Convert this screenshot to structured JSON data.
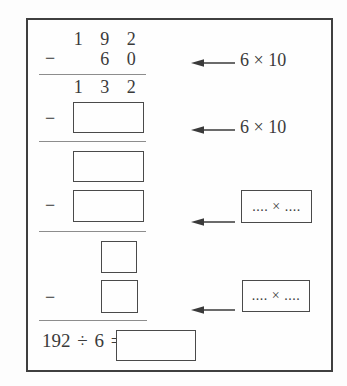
{
  "colors": {
    "frame_border": "#3f3f3f",
    "box_border": "#4a4a4a",
    "separator_line": "#8d8d8d",
    "text": "#3a3a3a",
    "background": "#fdfdfd"
  },
  "icons": {
    "arrow": "left-arrow-icon"
  },
  "worksheet": {
    "minus_sign": "−",
    "minuend_digits": [
      "1",
      "9",
      "2"
    ],
    "subtrahend_digits": [
      "6",
      "0"
    ],
    "difference_digits": [
      "1",
      "3",
      "2"
    ],
    "hint_label_1": "6 × 10",
    "hint_label_2": "6 × 10",
    "hint_box_1": ".... × ....",
    "hint_box_2": ".... × ....",
    "final_equation": "192 ÷ 6 ="
  }
}
